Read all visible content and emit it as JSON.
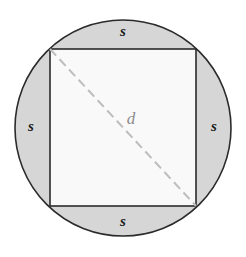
{
  "figure": {
    "name": "square-inscribed-in-circle",
    "background_color": "#ffffff",
    "circle": {
      "center_x": 123,
      "center_y": 128,
      "radius": 108,
      "fill_color": "#d6d6d6",
      "stroke_color": "#2b2b2b",
      "stroke_width": 1.6
    },
    "square": {
      "left": 50,
      "top": 49,
      "right": 196,
      "bottom": 206,
      "fill_color": "#f9f9f9",
      "stroke_color": "#2b2b2b",
      "stroke_width": 1.6
    },
    "diagonal": {
      "x1": 50,
      "y1": 49,
      "x2": 196,
      "y2": 206,
      "stroke_color": "#bdbdbd",
      "stroke_width": 2,
      "dash_pattern": "9 5"
    }
  },
  "labels": {
    "side_top": {
      "text": "s",
      "x": 123,
      "y": 33
    },
    "side_left": {
      "text": "s",
      "x": 31,
      "y": 128
    },
    "side_right": {
      "text": "s",
      "x": 214,
      "y": 128
    },
    "side_bottom": {
      "text": "s",
      "x": 123,
      "y": 223
    },
    "diagonal": {
      "text": "d",
      "x": 131,
      "y": 120
    }
  }
}
